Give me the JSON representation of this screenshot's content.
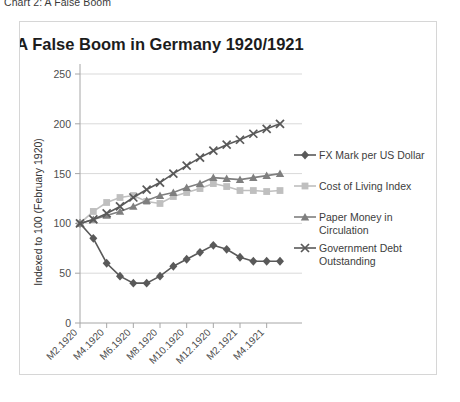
{
  "caption": "Chart 2: A False Boom",
  "chart_data": {
    "type": "line",
    "title": "A False Boom in Germany 1920/1921",
    "xlabel": "",
    "ylabel": "Indexed to 100 (February 1920)",
    "ylim": [
      0,
      250
    ],
    "yticks": [
      0,
      50,
      100,
      150,
      200,
      250
    ],
    "grid": true,
    "legend_position": "right",
    "x": [
      "M2.1920",
      "M3.1920",
      "M4.1920",
      "M5.1920",
      "M6.1920",
      "M7.1920",
      "M8.1920",
      "M9.1920",
      "M10.1920",
      "M11.1920",
      "M12.1920",
      "M1.1921",
      "M2.1921",
      "M3.1921",
      "M4.1921",
      "M5.1921"
    ],
    "xtick_labels": [
      "M2.1920",
      "M4.1920",
      "M6.1920",
      "M8.1920",
      "M10.1920",
      "M12.1920",
      "M2.1921",
      "M4.1921"
    ],
    "xtick_step": 2,
    "series": [
      {
        "name": "FX Mark per US Dollar",
        "marker": "diamond",
        "color": "#595959",
        "values": [
          100,
          85,
          60,
          47,
          40,
          40,
          47,
          57,
          64,
          71,
          78,
          74,
          66,
          62,
          62,
          62
        ]
      },
      {
        "name": "Cost of Living Index",
        "marker": "square",
        "color": "#bfbfbf",
        "values": [
          100,
          112,
          121,
          126,
          128,
          122,
          120,
          127,
          131,
          135,
          140,
          137,
          133,
          133,
          132,
          133
        ]
      },
      {
        "name": "Paper Money in Circulation",
        "marker": "triangle",
        "color": "#7f7f7f",
        "values": [
          100,
          104,
          108,
          112,
          117,
          123,
          128,
          131,
          136,
          140,
          146,
          145,
          144,
          146,
          148,
          150
        ]
      },
      {
        "name": "Government Debt Outstanding",
        "marker": "cross",
        "color": "#595959",
        "values": [
          100,
          104,
          110,
          117,
          126,
          134,
          141,
          150,
          158,
          166,
          173,
          179,
          184,
          190,
          195,
          200
        ]
      }
    ]
  }
}
